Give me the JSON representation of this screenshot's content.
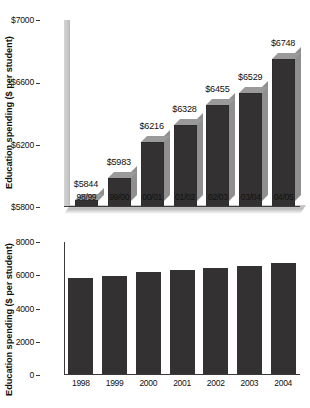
{
  "chart_data": [
    {
      "id": "truncated-axis-chart",
      "type": "bar",
      "title": "",
      "xlabel": "",
      "ylabel": "Education spending ($ per student)",
      "categories": [
        "98/99",
        "99/00",
        "00/01",
        "01/02",
        "02/03",
        "03/04",
        "04/05"
      ],
      "values": [
        5844,
        5983,
        6216,
        6328,
        6455,
        6529,
        6748
      ],
      "data_labels": [
        "$5844",
        "$5983",
        "$6216",
        "$6328",
        "$6455",
        "$6529",
        "$6748"
      ],
      "ylim": [
        5800,
        7000
      ],
      "yticks": [
        5800,
        6200,
        6600,
        7000
      ],
      "ytick_labels": [
        "$5800",
        "$6200",
        "$6600",
        "$7000"
      ],
      "grid": false,
      "legend": "none",
      "style": "3d-columns",
      "bar_color": "#333132",
      "bar_top_color": "#9a9a9a",
      "bar_side_color": "#8f8f8f"
    },
    {
      "id": "full-axis-chart",
      "type": "bar",
      "title": "",
      "xlabel": "",
      "ylabel": "Education spending ($ per student)",
      "categories": [
        "1998",
        "1999",
        "2000",
        "2001",
        "2002",
        "2003",
        "2004"
      ],
      "values": [
        5844,
        5983,
        6216,
        6328,
        6455,
        6529,
        6748
      ],
      "data_labels": [],
      "ylim": [
        0,
        8000
      ],
      "yticks": [
        0,
        2000,
        4000,
        6000,
        8000
      ],
      "ytick_labels": [
        "0",
        "2000",
        "4000",
        "6000",
        "8000"
      ],
      "grid": false,
      "legend": "none",
      "style": "flat-columns",
      "bar_color": "#333132"
    }
  ]
}
